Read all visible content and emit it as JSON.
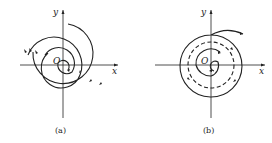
{
  "figures": [
    {
      "id": "a",
      "caption": "(a)",
      "x_label": "x",
      "y_label": "y",
      "origin_label": "O",
      "type": "spiral",
      "description": "Spiral trajectories diverging from origin"
    },
    {
      "id": "b",
      "caption": "(b)",
      "x_label": "x",
      "y_label": "y",
      "origin_label": "O",
      "type": "limit-cycle",
      "description": "Spirals approaching a dashed limit cycle"
    }
  ],
  "colors": {
    "stroke": "#222222",
    "background": "#ffffff"
  }
}
